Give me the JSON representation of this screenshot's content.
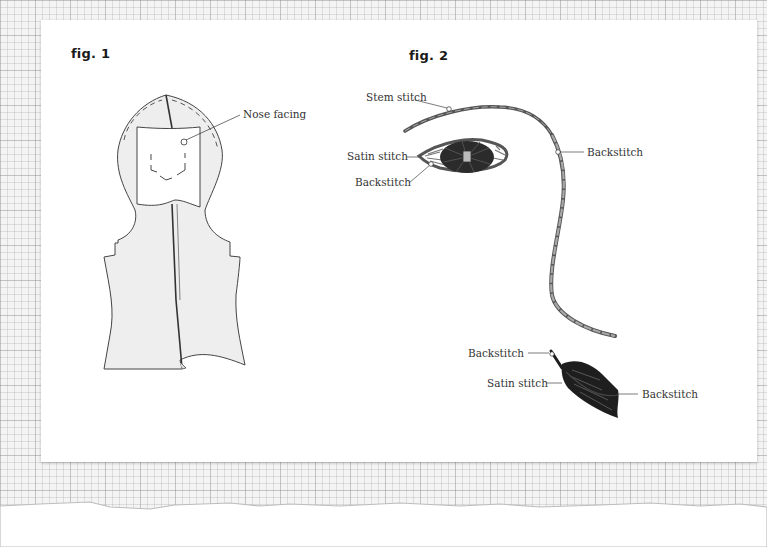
{
  "figures": [
    {
      "title": "fig. 1",
      "labels": [
        "Nose facing"
      ]
    },
    {
      "title": "fig. 2",
      "labels": {
        "brow": "Stem stitch",
        "eye_satin": "Satin stitch",
        "eye_outline": "Backstitch",
        "face_line": "Backstitch",
        "leaf_stem": "Backstitch",
        "leaf_satin": "Satin stitch",
        "leaf_vein": "Backstitch"
      }
    }
  ],
  "colors": {
    "paper": "#ffffff",
    "grid_bg": "#f4f4f4",
    "pattern_fill": "#eeeeee",
    "outline": "#444444",
    "thread_dark": "#1e1e1e",
    "thread_grey": "#8a8a8a"
  }
}
